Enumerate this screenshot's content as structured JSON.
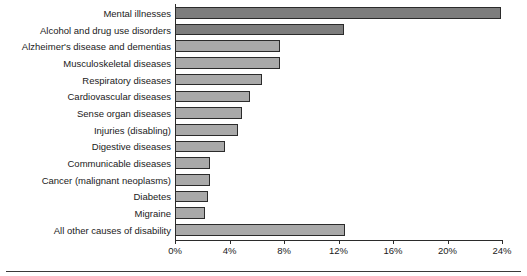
{
  "chart_data": {
    "type": "bar",
    "orientation": "horizontal",
    "title": "",
    "xlabel": "",
    "ylabel": "",
    "xlim": [
      0,
      24
    ],
    "xticks": [
      0,
      4,
      8,
      12,
      16,
      20,
      24
    ],
    "xtick_labels": [
      "0%",
      "4%",
      "8%",
      "12%",
      "16%",
      "20%",
      "24%"
    ],
    "grid": false,
    "legend": null,
    "categories": [
      "Mental illnesses",
      "Alcohol and drug use disorders",
      "Alzheimer's disease and dementias",
      "Musculoskeletal diseases",
      "Respiratory diseases",
      "Cardiovascular diseases",
      "Sense organ diseases",
      "Injuries (disabling)",
      "Digestive diseases",
      "Communicable diseases",
      "Cancer (malignant neoplasms)",
      "Diabetes",
      "Migraine",
      "All other causes of disability"
    ],
    "values": [
      23.9,
      12.4,
      7.7,
      7.7,
      6.4,
      5.5,
      4.9,
      4.6,
      3.7,
      2.6,
      2.6,
      2.4,
      2.2,
      12.5
    ],
    "value_labels": [
      "23.9%",
      "12.4%",
      "7.7%",
      "7.7%",
      "6.4%",
      "5.5%",
      "4.9%",
      "4.6%",
      "3.7%",
      "2.6%",
      "2.6%",
      "2.4%",
      "2.2%",
      "12.5%"
    ],
    "bar_colors": [
      "#7d7d7d",
      "#7d7d7d",
      "#a9a9a9",
      "#a9a9a9",
      "#a9a9a9",
      "#a9a9a9",
      "#a9a9a9",
      "#a9a9a9",
      "#a9a9a9",
      "#a9a9a9",
      "#a9a9a9",
      "#a9a9a9",
      "#a9a9a9",
      "#a9a9a9"
    ],
    "bar_edge_color": "#2b2b2b",
    "axis_color": "#2b2b2b",
    "background_color": "#ffffff"
  }
}
